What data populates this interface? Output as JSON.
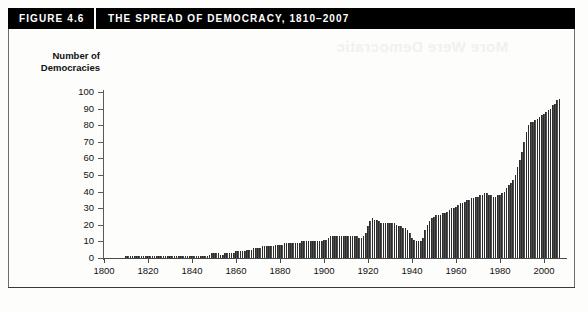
{
  "figure": {
    "number_label": "FIGURE 4.6",
    "title": "THE SPREAD OF DEMOCRACY, 1810–2007"
  },
  "ghost_text": {
    "title": "More Were Democratic",
    "bottom": "Source note"
  },
  "chart_data": {
    "type": "bar",
    "title": "THE SPREAD OF DEMOCRACY, 1810–2007",
    "xlabel": "",
    "ylabel": "Number of\nDemocracies",
    "xlim": [
      1800,
      2010
    ],
    "ylim": [
      0,
      100
    ],
    "ytick_values": [
      0,
      10,
      20,
      30,
      40,
      50,
      60,
      70,
      80,
      90,
      100
    ],
    "ytick_labels": [
      "0",
      "10",
      "20",
      "30",
      "40",
      "50",
      "60",
      "70",
      "80",
      "90",
      "100"
    ],
    "xtick_values": [
      1800,
      1820,
      1840,
      1860,
      1880,
      1900,
      1920,
      1940,
      1960,
      1980,
      2000
    ],
    "xtick_labels": [
      "1800",
      "1820",
      "1840",
      "1860",
      "1880",
      "1900",
      "1920",
      "1940",
      "1960",
      "1980",
      "2000"
    ],
    "grid": false,
    "legend": null,
    "bar_color": "#4f4f4f",
    "x": [
      1810,
      1811,
      1812,
      1813,
      1814,
      1815,
      1816,
      1817,
      1818,
      1819,
      1820,
      1821,
      1822,
      1823,
      1824,
      1825,
      1826,
      1827,
      1828,
      1829,
      1830,
      1831,
      1832,
      1833,
      1834,
      1835,
      1836,
      1837,
      1838,
      1839,
      1840,
      1841,
      1842,
      1843,
      1844,
      1845,
      1846,
      1847,
      1848,
      1849,
      1850,
      1851,
      1852,
      1853,
      1854,
      1855,
      1856,
      1857,
      1858,
      1859,
      1860,
      1861,
      1862,
      1863,
      1864,
      1865,
      1866,
      1867,
      1868,
      1869,
      1870,
      1871,
      1872,
      1873,
      1874,
      1875,
      1876,
      1877,
      1878,
      1879,
      1880,
      1881,
      1882,
      1883,
      1884,
      1885,
      1886,
      1887,
      1888,
      1889,
      1890,
      1891,
      1892,
      1893,
      1894,
      1895,
      1896,
      1897,
      1898,
      1899,
      1900,
      1901,
      1902,
      1903,
      1904,
      1905,
      1906,
      1907,
      1908,
      1909,
      1910,
      1911,
      1912,
      1913,
      1914,
      1915,
      1916,
      1917,
      1918,
      1919,
      1920,
      1921,
      1922,
      1923,
      1924,
      1925,
      1926,
      1927,
      1928,
      1929,
      1930,
      1931,
      1932,
      1933,
      1934,
      1935,
      1936,
      1937,
      1938,
      1939,
      1940,
      1941,
      1942,
      1943,
      1944,
      1945,
      1946,
      1947,
      1948,
      1949,
      1950,
      1951,
      1952,
      1953,
      1954,
      1955,
      1956,
      1957,
      1958,
      1959,
      1960,
      1961,
      1962,
      1963,
      1964,
      1965,
      1966,
      1967,
      1968,
      1969,
      1970,
      1971,
      1972,
      1973,
      1974,
      1975,
      1976,
      1977,
      1978,
      1979,
      1980,
      1981,
      1982,
      1983,
      1984,
      1985,
      1986,
      1987,
      1988,
      1989,
      1990,
      1991,
      1992,
      1993,
      1994,
      1995,
      1996,
      1997,
      1998,
      1999,
      2000,
      2001,
      2002,
      2003,
      2004,
      2005,
      2006,
      2007
    ],
    "values": [
      1,
      1,
      1,
      1,
      1,
      1,
      1,
      1,
      1,
      1,
      1,
      1,
      1,
      1,
      1,
      1,
      1,
      1,
      1,
      1,
      1,
      1,
      1,
      1,
      1,
      1,
      1,
      1,
      1,
      1,
      1,
      1,
      1,
      1,
      1,
      1,
      1,
      1,
      2,
      3,
      3,
      3,
      3,
      2,
      2,
      3,
      3,
      3,
      3,
      3,
      4,
      4,
      4,
      4,
      4,
      5,
      5,
      5,
      6,
      6,
      6,
      6,
      7,
      7,
      7,
      7,
      7,
      7,
      8,
      8,
      8,
      8,
      9,
      9,
      9,
      9,
      9,
      9,
      9,
      9,
      10,
      10,
      10,
      10,
      10,
      10,
      10,
      10,
      10,
      10,
      11,
      11,
      12,
      13,
      13,
      13,
      13,
      13,
      13,
      13,
      13,
      13,
      13,
      13,
      13,
      13,
      12,
      12,
      13,
      15,
      19,
      22,
      24,
      23,
      23,
      22,
      21,
      21,
      21,
      21,
      21,
      21,
      21,
      20,
      19,
      19,
      18,
      18,
      17,
      15,
      12,
      11,
      10,
      10,
      10,
      12,
      17,
      20,
      22,
      24,
      25,
      26,
      26,
      26,
      27,
      27,
      28,
      29,
      30,
      30,
      31,
      32,
      33,
      33,
      34,
      35,
      35,
      36,
      36,
      37,
      37,
      38,
      38,
      39,
      39,
      38,
      38,
      37,
      37,
      38,
      38,
      39,
      40,
      42,
      44,
      45,
      47,
      50,
      55,
      59,
      64,
      70,
      76,
      80,
      82,
      82,
      83,
      84,
      85,
      86,
      87,
      88,
      89,
      90,
      92,
      93,
      95,
      96
    ]
  }
}
